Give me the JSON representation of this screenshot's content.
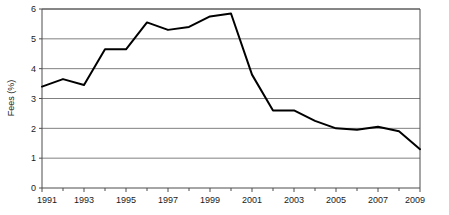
{
  "chart_data": {
    "type": "line",
    "title": "",
    "subtitle": "",
    "xlabel": "",
    "ylabel": "Fees (%)",
    "x": [
      1991,
      1992,
      1993,
      1994,
      1995,
      1996,
      1997,
      1998,
      1999,
      2000,
      2001,
      2002,
      2003,
      2004,
      2005,
      2006,
      2007,
      2008,
      2009
    ],
    "values": [
      3.4,
      3.65,
      3.45,
      4.65,
      4.65,
      5.55,
      5.3,
      5.4,
      5.75,
      5.85,
      3.8,
      2.6,
      2.6,
      2.25,
      2.0,
      1.95,
      2.05,
      1.9,
      1.3
    ],
    "series": [
      {
        "name": "Fees",
        "values": [
          3.4,
          3.65,
          3.45,
          4.65,
          4.65,
          5.55,
          5.3,
          5.4,
          5.75,
          5.85,
          3.8,
          2.6,
          2.6,
          2.25,
          2.0,
          1.95,
          2.05,
          1.9,
          1.3
        ]
      }
    ],
    "xlim": [
      1991,
      2009
    ],
    "ylim": [
      0,
      6
    ],
    "y_ticks": [
      0,
      1,
      2,
      3,
      4,
      5,
      6
    ],
    "y_tick_labels": [
      "0",
      "1",
      "2",
      "3",
      "4",
      "5",
      "6"
    ],
    "x_ticks": [
      1991,
      1993,
      1995,
      1997,
      1999,
      2001,
      2003,
      2005,
      2007,
      2009
    ],
    "x_tick_labels": [
      "1991",
      "1993",
      "1995",
      "1997",
      "1999",
      "2001",
      "2003",
      "2005",
      "2007",
      "2009"
    ],
    "x_minor_ticks": [
      1992,
      1994,
      1996,
      1998,
      2000,
      2002,
      2004,
      2006,
      2008
    ],
    "grid": true,
    "grid_axis": "y",
    "legend": false,
    "legend_position": "none",
    "line_color": "#000000",
    "grid_color": "#808080",
    "axis_color": "#4d4d4d",
    "background_color": "#ffffff",
    "annotations": []
  },
  "geometry": {
    "plot_left": 42,
    "plot_right": 420,
    "plot_top": 9,
    "plot_bottom": 188
  }
}
